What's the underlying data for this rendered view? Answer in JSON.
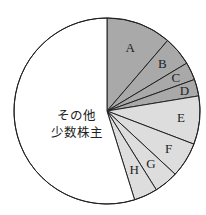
{
  "chart_data": {
    "type": "pie",
    "title": "",
    "start_angle_deg": 0,
    "direction": "clockwise",
    "categories": [
      "A",
      "B",
      "C",
      "D",
      "E",
      "F",
      "G",
      "H",
      "その他少数株主"
    ],
    "values": [
      11.3,
      5.1,
      3.1,
      2.9,
      8.4,
      6.1,
      4.2,
      4.1,
      54.8
    ],
    "units": "%",
    "slices": [
      {
        "label": "A",
        "value": 11.3,
        "color": "#a9a9a9"
      },
      {
        "label": "B",
        "value": 5.1,
        "color": "#a9a9a9"
      },
      {
        "label": "C",
        "value": 3.1,
        "color": "#a9a9a9"
      },
      {
        "label": "D",
        "value": 2.9,
        "color": "#a9a9a9"
      },
      {
        "label": "E",
        "value": 8.4,
        "color": "#dddddd"
      },
      {
        "label": "F",
        "value": 6.1,
        "color": "#dddddd"
      },
      {
        "label": "G",
        "value": 4.2,
        "color": "#dddddd"
      },
      {
        "label": "H",
        "value": 4.1,
        "color": "#dddddd"
      },
      {
        "label": "その他少数株主",
        "value": 54.8,
        "color": "#ffffff"
      }
    ],
    "other_label_lines": [
      "その他",
      "少数株主"
    ],
    "legend": "none (labels inside slices)"
  },
  "colors": {
    "dark_group": "#a9a9a9",
    "light_group": "#dddddd",
    "other": "#ffffff",
    "stroke": "#222222"
  }
}
